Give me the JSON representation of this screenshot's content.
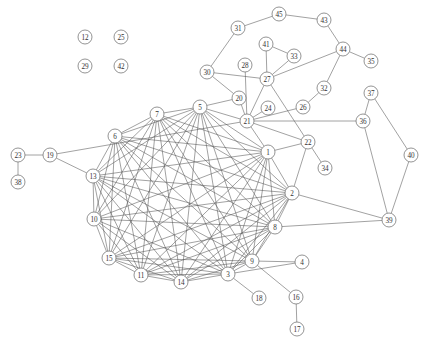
{
  "diagram": {
    "type": "node-link-graph",
    "title": "",
    "background_color": "#ffffff",
    "node_fill_color": "#ffffff",
    "node_stroke_color": "#666666",
    "edge_color": "#555555",
    "label_color": "#333333",
    "node_radius": 7,
    "width": 425,
    "height": 346,
    "node_count": 45,
    "edge_count": 168,
    "nodes": [
      {
        "id": 1,
        "label": "1",
        "x": 268,
        "y": 152
      },
      {
        "id": 2,
        "label": "2",
        "x": 292,
        "y": 193
      },
      {
        "id": 3,
        "label": "3",
        "x": 228,
        "y": 274
      },
      {
        "id": 4,
        "label": "4",
        "x": 302,
        "y": 262
      },
      {
        "id": 5,
        "label": "5",
        "x": 200,
        "y": 107
      },
      {
        "id": 6,
        "label": "6",
        "x": 115,
        "y": 136
      },
      {
        "id": 7,
        "label": "7",
        "x": 157,
        "y": 114
      },
      {
        "id": 8,
        "label": "8",
        "x": 275,
        "y": 227
      },
      {
        "id": 9,
        "label": "9",
        "x": 252,
        "y": 261
      },
      {
        "id": 10,
        "label": "10",
        "x": 94,
        "y": 219
      },
      {
        "id": 11,
        "label": "11",
        "x": 141,
        "y": 275
      },
      {
        "id": 12,
        "label": "12",
        "x": 85,
        "y": 37
      },
      {
        "id": 13,
        "label": "13",
        "x": 93,
        "y": 176
      },
      {
        "id": 14,
        "label": "14",
        "x": 181,
        "y": 282
      },
      {
        "id": 15,
        "label": "15",
        "x": 109,
        "y": 258
      },
      {
        "id": 16,
        "label": "16",
        "x": 296,
        "y": 297
      },
      {
        "id": 17,
        "label": "17",
        "x": 297,
        "y": 329
      },
      {
        "id": 18,
        "label": "18",
        "x": 259,
        "y": 298
      },
      {
        "id": 19,
        "label": "19",
        "x": 50,
        "y": 155
      },
      {
        "id": 20,
        "label": "20",
        "x": 239,
        "y": 98
      },
      {
        "id": 21,
        "label": "21",
        "x": 247,
        "y": 121
      },
      {
        "id": 22,
        "label": "22",
        "x": 308,
        "y": 142
      },
      {
        "id": 23,
        "label": "23",
        "x": 18,
        "y": 155
      },
      {
        "id": 24,
        "label": "24",
        "x": 268,
        "y": 108
      },
      {
        "id": 25,
        "label": "25",
        "x": 121,
        "y": 37
      },
      {
        "id": 26,
        "label": "26",
        "x": 303,
        "y": 107
      },
      {
        "id": 27,
        "label": "27",
        "x": 267,
        "y": 79
      },
      {
        "id": 28,
        "label": "28",
        "x": 245,
        "y": 65
      },
      {
        "id": 29,
        "label": "29",
        "x": 85,
        "y": 66
      },
      {
        "id": 30,
        "label": "30",
        "x": 207,
        "y": 72
      },
      {
        "id": 31,
        "label": "31",
        "x": 238,
        "y": 28
      },
      {
        "id": 32,
        "label": "32",
        "x": 324,
        "y": 88
      },
      {
        "id": 33,
        "label": "33",
        "x": 294,
        "y": 56
      },
      {
        "id": 34,
        "label": "34",
        "x": 325,
        "y": 168
      },
      {
        "id": 35,
        "label": "35",
        "x": 371,
        "y": 61
      },
      {
        "id": 36,
        "label": "36",
        "x": 363,
        "y": 121
      },
      {
        "id": 37,
        "label": "37",
        "x": 371,
        "y": 93
      },
      {
        "id": 38,
        "label": "38",
        "x": 18,
        "y": 182
      },
      {
        "id": 39,
        "label": "39",
        "x": 389,
        "y": 220
      },
      {
        "id": 40,
        "label": "40",
        "x": 411,
        "y": 155
      },
      {
        "id": 41,
        "label": "41",
        "x": 266,
        "y": 44
      },
      {
        "id": 42,
        "label": "42",
        "x": 121,
        "y": 66
      },
      {
        "id": 43,
        "label": "43",
        "x": 324,
        "y": 20
      },
      {
        "id": 44,
        "label": "44",
        "x": 343,
        "y": 49
      },
      {
        "id": 45,
        "label": "45",
        "x": 279,
        "y": 14
      }
    ],
    "edges": [
      [
        1,
        2
      ],
      [
        1,
        5
      ],
      [
        1,
        6
      ],
      [
        1,
        7
      ],
      [
        1,
        8
      ],
      [
        1,
        10
      ],
      [
        1,
        11
      ],
      [
        1,
        13
      ],
      [
        1,
        14
      ],
      [
        1,
        15
      ],
      [
        1,
        3
      ],
      [
        1,
        9
      ],
      [
        1,
        21
      ],
      [
        1,
        22
      ],
      [
        2,
        3
      ],
      [
        2,
        5
      ],
      [
        2,
        6
      ],
      [
        2,
        7
      ],
      [
        2,
        8
      ],
      [
        2,
        10
      ],
      [
        2,
        11
      ],
      [
        2,
        13
      ],
      [
        2,
        14
      ],
      [
        2,
        15
      ],
      [
        2,
        9
      ],
      [
        2,
        22
      ],
      [
        2,
        39
      ],
      [
        3,
        5
      ],
      [
        3,
        6
      ],
      [
        3,
        7
      ],
      [
        3,
        8
      ],
      [
        3,
        10
      ],
      [
        3,
        11
      ],
      [
        3,
        13
      ],
      [
        3,
        14
      ],
      [
        3,
        15
      ],
      [
        3,
        9
      ],
      [
        3,
        4
      ],
      [
        3,
        18
      ],
      [
        5,
        6
      ],
      [
        5,
        7
      ],
      [
        5,
        8
      ],
      [
        5,
        10
      ],
      [
        5,
        11
      ],
      [
        5,
        13
      ],
      [
        5,
        14
      ],
      [
        5,
        15
      ],
      [
        5,
        9
      ],
      [
        5,
        21
      ],
      [
        5,
        20
      ],
      [
        6,
        7
      ],
      [
        6,
        8
      ],
      [
        6,
        10
      ],
      [
        6,
        11
      ],
      [
        6,
        13
      ],
      [
        6,
        14
      ],
      [
        6,
        15
      ],
      [
        6,
        9
      ],
      [
        7,
        8
      ],
      [
        7,
        10
      ],
      [
        7,
        11
      ],
      [
        7,
        13
      ],
      [
        7,
        14
      ],
      [
        7,
        15
      ],
      [
        7,
        9
      ],
      [
        8,
        10
      ],
      [
        8,
        11
      ],
      [
        8,
        13
      ],
      [
        8,
        14
      ],
      [
        8,
        15
      ],
      [
        8,
        9
      ],
      [
        8,
        39
      ],
      [
        9,
        4
      ],
      [
        9,
        16
      ],
      [
        9,
        11
      ],
      [
        9,
        13
      ],
      [
        9,
        14
      ],
      [
        9,
        15
      ],
      [
        10,
        11
      ],
      [
        10,
        13
      ],
      [
        10,
        14
      ],
      [
        10,
        15
      ],
      [
        11,
        13
      ],
      [
        11,
        14
      ],
      [
        11,
        15
      ],
      [
        13,
        14
      ],
      [
        13,
        15
      ],
      [
        13,
        19
      ],
      [
        14,
        15
      ],
      [
        16,
        17
      ],
      [
        19,
        23
      ],
      [
        19,
        21
      ],
      [
        23,
        38
      ],
      [
        20,
        21
      ],
      [
        20,
        30
      ],
      [
        21,
        22
      ],
      [
        21,
        24
      ],
      [
        21,
        26
      ],
      [
        21,
        27
      ],
      [
        21,
        28
      ],
      [
        21,
        36
      ],
      [
        22,
        34
      ],
      [
        22,
        27
      ],
      [
        26,
        32
      ],
      [
        27,
        33
      ],
      [
        27,
        41
      ],
      [
        27,
        44
      ],
      [
        27,
        30
      ],
      [
        30,
        31
      ],
      [
        31,
        45
      ],
      [
        32,
        44
      ],
      [
        33,
        41
      ],
      [
        36,
        37
      ],
      [
        36,
        39
      ],
      [
        37,
        40
      ],
      [
        40,
        39
      ],
      [
        43,
        44
      ],
      [
        43,
        45
      ],
      [
        44,
        35
      ]
    ],
    "isolated_nodes": [
      12,
      25,
      29,
      42
    ]
  }
}
